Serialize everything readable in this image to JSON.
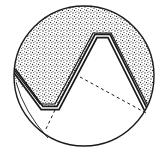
{
  "diagram": {
    "title": "",
    "colors": {
      "background": "#ffffff",
      "ink": "#1a1a1a",
      "stipple": "#2a2a2a"
    },
    "circle": {
      "cx": 84,
      "cy": 76,
      "r": 70
    },
    "profile_points": "14,70 42,108 58,108 96,36 109,36 147,112",
    "dashed_lines": [
      {
        "x1": 80,
        "y1": 77,
        "x2": 146,
        "y2": 113
      },
      {
        "x1": 55,
        "y1": 110,
        "x2": 45,
        "y2": 131
      }
    ]
  }
}
